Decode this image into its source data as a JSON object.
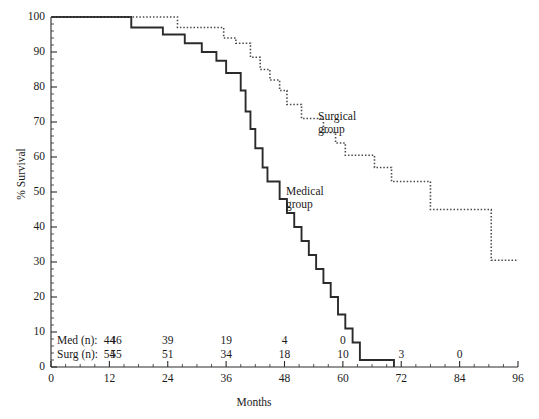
{
  "chart_data": {
    "type": "line",
    "subtype": "kaplan-meier-step",
    "title": "",
    "xlabel": "Months",
    "ylabel": "% Survival",
    "xlim": [
      0,
      96
    ],
    "ylim": [
      0,
      100
    ],
    "xticks": [
      0,
      12,
      24,
      36,
      48,
      60,
      72,
      84,
      96
    ],
    "xtick_labels": [
      "0",
      "12",
      "24",
      "36",
      "48",
      "60",
      "72",
      "84",
      "96"
    ],
    "yticks": [
      0,
      10,
      20,
      30,
      40,
      50,
      60,
      70,
      80,
      90,
      100
    ],
    "ytick_labels": [
      "0",
      "10",
      "20",
      "30",
      "40",
      "50",
      "60",
      "70",
      "80",
      "90",
      "100"
    ],
    "x_minor_tick_interval": 3,
    "y_minor_tick_interval": 2,
    "grid": false,
    "legend_position": "inline-annotations",
    "series": [
      {
        "name": "Medical group",
        "style": "solid",
        "color": "#2b2b2b",
        "label_line1": "Medical",
        "label_line2": "group",
        "points": [
          [
            0,
            100
          ],
          [
            16.5,
            100
          ],
          [
            16.5,
            97
          ],
          [
            23.0,
            97
          ],
          [
            23.0,
            95
          ],
          [
            27.5,
            95
          ],
          [
            27.5,
            92.5
          ],
          [
            31.0,
            92.5
          ],
          [
            31.0,
            90
          ],
          [
            34.0,
            90
          ],
          [
            34.0,
            87.5
          ],
          [
            36.0,
            87.5
          ],
          [
            36.0,
            84
          ],
          [
            39.0,
            84
          ],
          [
            39.0,
            79
          ],
          [
            40.0,
            79
          ],
          [
            40.0,
            73
          ],
          [
            41.0,
            73
          ],
          [
            41.0,
            68
          ],
          [
            42.0,
            68
          ],
          [
            42.0,
            62.5
          ],
          [
            43.5,
            62.5
          ],
          [
            43.5,
            57
          ],
          [
            44.5,
            57
          ],
          [
            44.5,
            53
          ],
          [
            47.0,
            53
          ],
          [
            47.0,
            48
          ],
          [
            48.5,
            48
          ],
          [
            48.5,
            44
          ],
          [
            50.0,
            44
          ],
          [
            50.0,
            40
          ],
          [
            51.5,
            40
          ],
          [
            51.5,
            36
          ],
          [
            53.0,
            36
          ],
          [
            53.0,
            32
          ],
          [
            54.5,
            32
          ],
          [
            54.5,
            28
          ],
          [
            56.0,
            28
          ],
          [
            56.0,
            24
          ],
          [
            57.5,
            24
          ],
          [
            57.5,
            20
          ],
          [
            59.0,
            20
          ],
          [
            59.0,
            15
          ],
          [
            60.5,
            15
          ],
          [
            60.5,
            11
          ],
          [
            62.0,
            11
          ],
          [
            62.0,
            7
          ],
          [
            63.5,
            7
          ],
          [
            63.5,
            2
          ],
          [
            70.5,
            2
          ],
          [
            70.5,
            0
          ]
        ]
      },
      {
        "name": "Surgical group",
        "style": "dotted",
        "color": "#4a4a4a",
        "label_line1": "Surgical",
        "label_line2": "group",
        "points": [
          [
            0,
            100
          ],
          [
            26.0,
            100
          ],
          [
            26.0,
            97
          ],
          [
            35.5,
            97
          ],
          [
            35.5,
            94
          ],
          [
            38.0,
            94
          ],
          [
            38.0,
            92.5
          ],
          [
            41.0,
            92.5
          ],
          [
            41.0,
            88.5
          ],
          [
            43.0,
            88.5
          ],
          [
            43.0,
            85
          ],
          [
            45.0,
            85
          ],
          [
            45.0,
            82
          ],
          [
            47.0,
            82
          ],
          [
            47.0,
            79
          ],
          [
            48.5,
            79
          ],
          [
            48.5,
            75
          ],
          [
            51.5,
            75
          ],
          [
            51.5,
            71
          ],
          [
            56.0,
            71
          ],
          [
            56.0,
            67
          ],
          [
            58.5,
            67
          ],
          [
            58.5,
            64
          ],
          [
            60.5,
            64
          ],
          [
            60.5,
            60.5
          ],
          [
            66.5,
            60.5
          ],
          [
            66.5,
            57
          ],
          [
            70.0,
            57
          ],
          [
            70.0,
            53
          ],
          [
            78.0,
            53
          ],
          [
            78.0,
            45
          ],
          [
            90.5,
            45
          ],
          [
            90.5,
            30.5
          ],
          [
            96.0,
            30.5
          ]
        ]
      }
    ],
    "at_risk_table": {
      "positions_months": [
        0,
        12,
        24,
        36,
        48,
        60,
        72,
        84,
        96
      ],
      "rows": [
        {
          "label": "Med (n):",
          "first_value": "46",
          "values": [
            "46",
            "44",
            "39",
            "19",
            "4",
            "0",
            "",
            "",
            ""
          ]
        },
        {
          "label": "Surg (n):",
          "first_value": "55",
          "values": [
            "55",
            "54",
            "51",
            "34",
            "18",
            "10",
            "3",
            "0",
            ""
          ]
        }
      ]
    }
  },
  "colors": {
    "axis": "#2b2b2b",
    "medical": "#2b2b2b",
    "surgical": "#4a4a4a",
    "text": "#1a1a1a",
    "background": "#ffffff"
  }
}
